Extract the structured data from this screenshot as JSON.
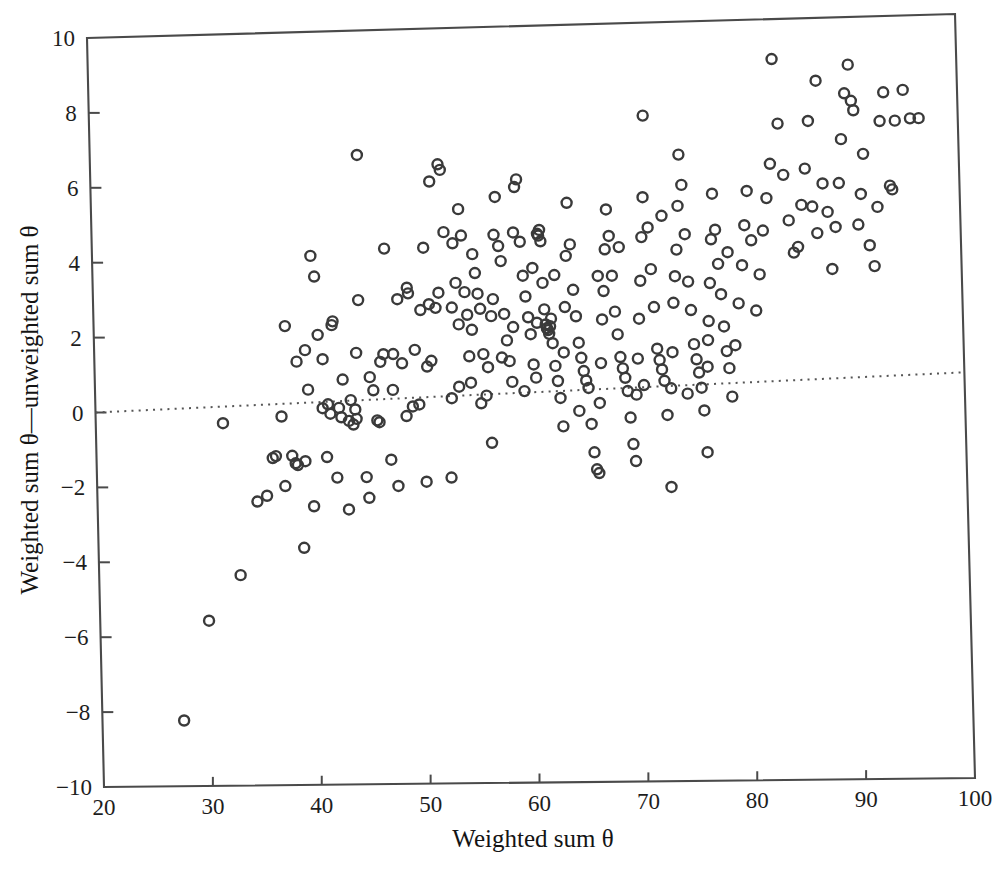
{
  "chart_data": {
    "type": "scatter",
    "title": "",
    "xlabel": "Weighted sum θ",
    "ylabel": "Weighted sum θ—unweighted sum θ",
    "xlim": [
      20,
      100
    ],
    "ylim": [
      -10,
      10
    ],
    "xticks": [
      20,
      30,
      40,
      50,
      60,
      70,
      80,
      90,
      100
    ],
    "xtick_labels": [
      "20",
      "30",
      "40",
      "50",
      "60",
      "70",
      "80",
      "90",
      "100"
    ],
    "yticks": [
      -10,
      -8,
      -6,
      -4,
      -2,
      0,
      2,
      4,
      6,
      8,
      10
    ],
    "ytick_labels": [
      "-10",
      "-8",
      "-6",
      "-4",
      "-2",
      "0",
      "2",
      "4",
      "6",
      "8",
      "10"
    ],
    "grid": false,
    "legend": false,
    "marker": {
      "shape": "circle-open",
      "size_px": 10,
      "stroke_color": "#3a3a3a",
      "fill": "none"
    },
    "annotations": [
      {
        "name": "trend-line",
        "type": "dotted-line",
        "style": "dotted",
        "color": "#555555",
        "x_start": 20,
        "y_start": 0.0,
        "x_end": 100,
        "y_end": 0.62,
        "slope": 0.00775,
        "intercept": -0.155
      }
    ],
    "n_points": 352,
    "points": [
      [
        27.5,
        -8.25
      ],
      [
        30.0,
        -5.6
      ],
      [
        33.0,
        -4.4
      ],
      [
        31.7,
        -0.35
      ],
      [
        34.7,
        -2.45
      ],
      [
        35.6,
        -2.3
      ],
      [
        36.2,
        -1.3
      ],
      [
        36.5,
        -1.25
      ],
      [
        37.1,
        -0.2
      ],
      [
        37.3,
        -2.05
      ],
      [
        37.6,
        2.2
      ],
      [
        38.0,
        -1.25
      ],
      [
        38.3,
        -1.45
      ],
      [
        38.5,
        -1.5
      ],
      [
        38.6,
        1.25
      ],
      [
        38.9,
        -3.7
      ],
      [
        39.2,
        -1.4
      ],
      [
        39.4,
        1.55
      ],
      [
        39.6,
        0.5
      ],
      [
        39.9,
        -2.6
      ],
      [
        40.1,
        4.05
      ],
      [
        40.4,
        3.5
      ],
      [
        40.6,
        1.95
      ],
      [
        40.9,
        0.0
      ],
      [
        41.2,
        -1.3
      ],
      [
        41.4,
        0.1
      ],
      [
        41.6,
        -0.15
      ],
      [
        41.9,
        2.2
      ],
      [
        42.1,
        -1.85
      ],
      [
        42.4,
        0.0
      ],
      [
        42.6,
        -0.25
      ],
      [
        42.8,
        0.75
      ],
      [
        43.1,
        -2.7
      ],
      [
        43.3,
        -0.35
      ],
      [
        43.5,
        0.2
      ],
      [
        43.7,
        -0.45
      ],
      [
        43.9,
        -0.05
      ],
      [
        44.1,
        1.45
      ],
      [
        44.4,
        2.85
      ],
      [
        44.6,
        6.7
      ],
      [
        44.8,
        -1.85
      ],
      [
        45.0,
        -2.4
      ],
      [
        45.3,
        0.8
      ],
      [
        45.6,
        0.45
      ],
      [
        45.9,
        -0.35
      ],
      [
        46.1,
        -0.4
      ],
      [
        46.3,
        1.2
      ],
      [
        46.6,
        1.4
      ],
      [
        46.9,
        4.2
      ],
      [
        47.1,
        -1.4
      ],
      [
        47.4,
        0.45
      ],
      [
        47.7,
        -2.1
      ],
      [
        48.0,
        2.85
      ],
      [
        48.3,
        1.15
      ],
      [
        48.6,
        -0.25
      ],
      [
        48.9,
        3.15
      ],
      [
        49.2,
        0.0
      ],
      [
        49.5,
        1.5
      ],
      [
        49.8,
        0.05
      ],
      [
        50.1,
        2.55
      ],
      [
        50.3,
        -2.0
      ],
      [
        50.6,
        1.05
      ],
      [
        50.9,
        2.7
      ],
      [
        51.2,
        5.95
      ],
      [
        51.5,
        2.6
      ],
      [
        51.8,
        3.0
      ],
      [
        52.0,
        6.4
      ],
      [
        52.2,
        6.25
      ],
      [
        52.4,
        4.6
      ],
      [
        52.6,
        -1.9
      ],
      [
        52.8,
        0.2
      ],
      [
        53.0,
        2.6
      ],
      [
        53.2,
        4.3
      ],
      [
        53.4,
        3.25
      ],
      [
        53.6,
        2.15
      ],
      [
        53.8,
        5.2
      ],
      [
        54.0,
        4.5
      ],
      [
        54.2,
        3.0
      ],
      [
        54.4,
        2.4
      ],
      [
        54.6,
        0.6
      ],
      [
        54.8,
        2.0
      ],
      [
        55.0,
        4.0
      ],
      [
        55.2,
        3.5
      ],
      [
        55.4,
        2.95
      ],
      [
        55.6,
        2.55
      ],
      [
        55.8,
        1.35
      ],
      [
        56.0,
        0.25
      ],
      [
        56.2,
        1.0
      ],
      [
        56.4,
        -1.0
      ],
      [
        56.6,
        2.35
      ],
      [
        56.8,
        2.8
      ],
      [
        57.0,
        4.5
      ],
      [
        57.2,
        5.5
      ],
      [
        57.4,
        4.2
      ],
      [
        57.6,
        3.8
      ],
      [
        57.8,
        2.4
      ],
      [
        58.0,
        1.7
      ],
      [
        58.2,
        1.15
      ],
      [
        58.4,
        0.6
      ],
      [
        58.6,
        2.05
      ],
      [
        58.8,
        4.55
      ],
      [
        59.0,
        5.75
      ],
      [
        59.2,
        5.95
      ],
      [
        59.4,
        4.3
      ],
      [
        59.6,
        3.4
      ],
      [
        59.8,
        2.85
      ],
      [
        60.0,
        2.3
      ],
      [
        60.2,
        1.85
      ],
      [
        60.4,
        1.05
      ],
      [
        60.6,
        0.7
      ],
      [
        60.8,
        2.15
      ],
      [
        61.0,
        4.5
      ],
      [
        61.1,
        4.45
      ],
      [
        61.2,
        4.6
      ],
      [
        61.3,
        4.3
      ],
      [
        61.4,
        3.2
      ],
      [
        61.5,
        2.5
      ],
      [
        61.6,
        2.1
      ],
      [
        61.7,
        2.0
      ],
      [
        61.8,
        1.95
      ],
      [
        61.9,
        1.85
      ],
      [
        62.0,
        2.05
      ],
      [
        62.1,
        2.25
      ],
      [
        62.2,
        1.6
      ],
      [
        62.4,
        1.0
      ],
      [
        62.6,
        0.6
      ],
      [
        62.8,
        0.15
      ],
      [
        63.0,
        -0.6
      ],
      [
        63.2,
        1.35
      ],
      [
        63.4,
        2.55
      ],
      [
        63.6,
        3.9
      ],
      [
        63.8,
        5.3
      ],
      [
        64.0,
        4.2
      ],
      [
        64.2,
        3.0
      ],
      [
        64.4,
        2.3
      ],
      [
        64.6,
        1.6
      ],
      [
        64.8,
        1.2
      ],
      [
        65.0,
        0.85
      ],
      [
        65.2,
        0.6
      ],
      [
        65.4,
        0.4
      ],
      [
        65.6,
        -0.55
      ],
      [
        65.8,
        -1.3
      ],
      [
        66.0,
        -1.75
      ],
      [
        66.2,
        -1.85
      ],
      [
        66.4,
        0.0
      ],
      [
        66.6,
        1.05
      ],
      [
        66.8,
        2.2
      ],
      [
        67.0,
        2.95
      ],
      [
        67.2,
        4.05
      ],
      [
        67.4,
        5.1
      ],
      [
        67.6,
        4.4
      ],
      [
        67.8,
        3.35
      ],
      [
        68.0,
        2.4
      ],
      [
        68.2,
        1.8
      ],
      [
        68.4,
        1.2
      ],
      [
        68.6,
        0.9
      ],
      [
        68.8,
        0.65
      ],
      [
        69.0,
        0.3
      ],
      [
        69.2,
        -0.4
      ],
      [
        69.4,
        -1.1
      ],
      [
        69.6,
        -1.55
      ],
      [
        69.8,
        0.2
      ],
      [
        70.0,
        1.15
      ],
      [
        70.2,
        2.2
      ],
      [
        70.4,
        3.2
      ],
      [
        70.6,
        4.35
      ],
      [
        70.8,
        5.4
      ],
      [
        71.0,
        7.55
      ],
      [
        71.2,
        4.6
      ],
      [
        71.4,
        3.5
      ],
      [
        71.6,
        2.5
      ],
      [
        71.8,
        1.4
      ],
      [
        72.0,
        1.1
      ],
      [
        72.2,
        0.85
      ],
      [
        72.4,
        0.55
      ],
      [
        72.6,
        -0.35
      ],
      [
        72.8,
        -2.25
      ],
      [
        73.0,
        0.35
      ],
      [
        73.2,
        1.3
      ],
      [
        73.4,
        2.6
      ],
      [
        73.6,
        3.3
      ],
      [
        73.8,
        4.0
      ],
      [
        74.0,
        5.15
      ],
      [
        74.2,
        6.5
      ],
      [
        74.4,
        5.7
      ],
      [
        74.6,
        4.4
      ],
      [
        74.8,
        3.15
      ],
      [
        75.0,
        2.4
      ],
      [
        75.2,
        1.5
      ],
      [
        75.4,
        1.1
      ],
      [
        75.6,
        0.75
      ],
      [
        75.8,
        0.35
      ],
      [
        76.0,
        -0.25
      ],
      [
        76.2,
        -1.35
      ],
      [
        76.4,
        0.9
      ],
      [
        76.6,
        2.1
      ],
      [
        76.8,
        3.1
      ],
      [
        77.0,
        4.25
      ],
      [
        77.2,
        5.45
      ],
      [
        77.4,
        4.5
      ],
      [
        77.6,
        3.6
      ],
      [
        77.8,
        2.8
      ],
      [
        78.0,
        1.95
      ],
      [
        78.2,
        1.3
      ],
      [
        78.4,
        0.85
      ],
      [
        78.6,
        0.1
      ],
      [
        79.0,
        1.45
      ],
      [
        79.4,
        2.55
      ],
      [
        79.8,
        3.55
      ],
      [
        80.1,
        4.6
      ],
      [
        80.4,
        5.5
      ],
      [
        80.7,
        4.2
      ],
      [
        81.0,
        2.35
      ],
      [
        81.4,
        3.3
      ],
      [
        81.8,
        4.45
      ],
      [
        82.2,
        5.3
      ],
      [
        82.6,
        6.2
      ],
      [
        83.0,
        8.95
      ],
      [
        83.4,
        7.25
      ],
      [
        83.8,
        5.9
      ],
      [
        84.2,
        4.7
      ],
      [
        84.6,
        3.85
      ],
      [
        85.0,
        4.0
      ],
      [
        85.4,
        5.1
      ],
      [
        85.8,
        6.05
      ],
      [
        86.2,
        7.3
      ],
      [
        86.4,
        5.05
      ],
      [
        86.8,
        4.35
      ],
      [
        87.0,
        8.35
      ],
      [
        87.4,
        5.65
      ],
      [
        87.8,
        4.9
      ],
      [
        88.1,
        3.4
      ],
      [
        88.5,
        4.5
      ],
      [
        88.9,
        5.65
      ],
      [
        89.2,
        6.8
      ],
      [
        89.6,
        8.0
      ],
      [
        90.0,
        8.75
      ],
      [
        90.2,
        7.8
      ],
      [
        90.4,
        7.55
      ],
      [
        90.6,
        4.55
      ],
      [
        90.9,
        5.35
      ],
      [
        91.2,
        6.4
      ],
      [
        91.6,
        4.0
      ],
      [
        92.0,
        3.45
      ],
      [
        92.4,
        5.0
      ],
      [
        92.8,
        7.25
      ],
      [
        93.2,
        8.0
      ],
      [
        93.6,
        5.55
      ],
      [
        93.8,
        5.45
      ],
      [
        94.2,
        7.25
      ],
      [
        95.0,
        8.05
      ],
      [
        95.6,
        7.3
      ],
      [
        96.4,
        7.3
      ],
      [
        41.0,
        1.3
      ],
      [
        42.0,
        2.3
      ],
      [
        44.0,
        -0.3
      ],
      [
        47.5,
        1.4
      ],
      [
        49.0,
        3.0
      ],
      [
        50.5,
        4.2
      ],
      [
        51.0,
        1.2
      ],
      [
        53.5,
        0.5
      ],
      [
        54.5,
        1.3
      ],
      [
        55.5,
        0.05
      ],
      [
        57.5,
        1.25
      ],
      [
        59.5,
        0.35
      ],
      [
        60.5,
        3.6
      ],
      [
        62.5,
        3.4
      ],
      [
        64.5,
        -0.2
      ],
      [
        66.5,
        3.35
      ],
      [
        68.5,
        4.1
      ],
      [
        70.5,
        0.45
      ],
      [
        72.5,
        4.9
      ],
      [
        74.5,
        0.2
      ],
      [
        76.5,
        1.6
      ],
      [
        78.5,
        3.9
      ]
    ]
  },
  "axes": {
    "frame_color": "#4a4a4a",
    "background": "#ffffff"
  }
}
